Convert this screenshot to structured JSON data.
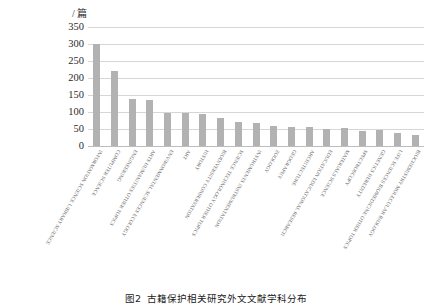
{
  "chart_data": {
    "type": "bar",
    "title": "",
    "caption_label": "图2",
    "caption_text": "古籍保护相关研究外文文献学科分布",
    "unit_label": "/ 篇",
    "xlabel": "",
    "ylabel": "/ 篇",
    "ylim": [
      0,
      350
    ],
    "ytick_values": [
      0,
      50,
      100,
      150,
      200,
      250,
      300,
      350
    ],
    "ytick_labels": [
      "0",
      "50",
      "100",
      "150",
      "200",
      "250",
      "300",
      "350"
    ],
    "grid": true,
    "legend": false,
    "bar_color": "#b2b2b2",
    "categories": [
      "INFORMATION SCIENCE LIBRARY SCIENCE",
      "COMPUTER SCIENCE",
      "ENGINEERING",
      "ARTS HUMANITIES OTHER TOPICS",
      "ENVIRONMENTAL SCIENCES ECOLOGY",
      "ART",
      "HISTORY",
      "BIODIVERSITY CONSERVATION",
      "SCIENCE TECHNOLOGY OTHER TOPICS",
      "INSTRUMENTS INSTRUMENTATION",
      "ZOOLOGY",
      "GEOGRAPHY",
      "ARCHITECTURE",
      "EDUCATION EDUCATIONAL RESEARCH",
      "MATERIALS SCIENCE",
      "SPECTROSCOPY",
      "GENETICS HEREDITY",
      "LIFE SCIENCES BIOMEDICINE OTHER TOPICS",
      "BIOCHEMISTRY MOLECULAR BIOLOGY"
    ],
    "values": [
      300,
      222,
      137,
      136,
      98,
      98,
      95,
      82,
      70,
      68,
      60,
      56,
      57,
      50,
      52,
      45,
      46,
      38,
      33
    ]
  }
}
